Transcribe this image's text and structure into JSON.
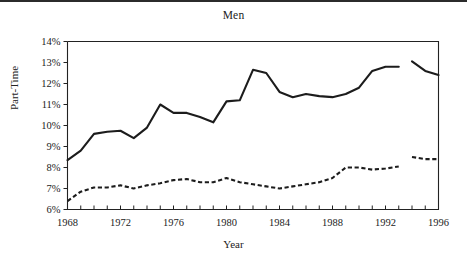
{
  "figure": {
    "title": "Men",
    "xlabel": "Year",
    "ylabel": "Part-Time"
  },
  "chart_data": {
    "type": "line",
    "title": "Men",
    "xlabel": "Year",
    "ylabel": "Part-Time",
    "xlim": [
      1968,
      1996
    ],
    "ylim": [
      6,
      14
    ],
    "grid": false,
    "legend": "none",
    "y_tick_labels": [
      "6%",
      "7%",
      "8%",
      "9%",
      "10%",
      "11%",
      "12%",
      "13%",
      "14%"
    ],
    "y_tick_values": [
      6,
      7,
      8,
      9,
      10,
      11,
      12,
      13,
      14
    ],
    "x_tick_labels": [
      "1968",
      "1972",
      "1976",
      "1980",
      "1984",
      "1988",
      "1992",
      "1996"
    ],
    "x_tick_values": [
      1968,
      1972,
      1976,
      1980,
      1984,
      1988,
      1992,
      1996
    ],
    "x_minor_ticks": [
      1968,
      1969,
      1970,
      1971,
      1972,
      1973,
      1974,
      1975,
      1976,
      1977,
      1978,
      1979,
      1980,
      1981,
      1982,
      1983,
      1984,
      1985,
      1986,
      1987,
      1988,
      1989,
      1990,
      1991,
      1992,
      1993,
      1994,
      1995,
      1996
    ],
    "x": [
      1968,
      1969,
      1970,
      1971,
      1972,
      1973,
      1974,
      1975,
      1976,
      1977,
      1978,
      1979,
      1980,
      1981,
      1982,
      1983,
      1984,
      1985,
      1986,
      1987,
      1988,
      1989,
      1990,
      1991,
      1992,
      1993,
      1994,
      1995,
      1996
    ],
    "series": [
      {
        "name": "solid-series",
        "style": "solid",
        "color": "#1c1c1c",
        "break_after_year": 1993,
        "values": [
          8.35,
          8.8,
          9.6,
          9.7,
          9.75,
          9.4,
          9.9,
          11.0,
          10.6,
          10.6,
          10.4,
          10.15,
          11.15,
          11.2,
          12.65,
          12.5,
          11.6,
          11.35,
          11.5,
          11.4,
          11.35,
          11.5,
          11.8,
          12.6,
          12.8,
          12.8,
          13.05,
          12.6,
          12.4
        ]
      },
      {
        "name": "dashed-series",
        "style": "dashed",
        "color": "#1c1c1c",
        "break_after_year": 1993,
        "values": [
          6.4,
          6.85,
          7.05,
          7.05,
          7.15,
          7.0,
          7.15,
          7.25,
          7.4,
          7.45,
          7.3,
          7.3,
          7.5,
          7.3,
          7.2,
          7.1,
          7.0,
          7.1,
          7.2,
          7.3,
          7.5,
          8.0,
          8.0,
          7.9,
          7.95,
          8.05,
          8.5,
          8.4,
          8.4
        ]
      }
    ]
  }
}
